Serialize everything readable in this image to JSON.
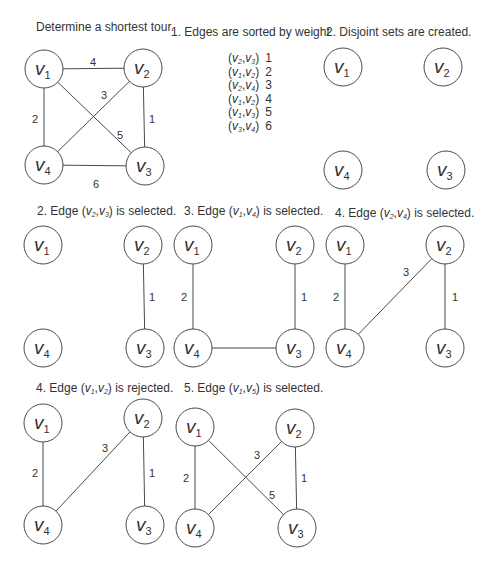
{
  "colors": {
    "stroke": "#4a4a4a",
    "text": "#333333",
    "node_fill": "#ffffff",
    "background": "#ffffff"
  },
  "node_radius": 19,
  "panels": [
    {
      "id": "initial-graph",
      "title": {
        "prefix": "Determine a shortest tour.",
        "edge": null,
        "suffix": ""
      },
      "title_pos": {
        "x": 36,
        "y": 20
      },
      "nodes": [
        {
          "label": "v",
          "sub": "1",
          "x": 44,
          "y": 69
        },
        {
          "label": "v",
          "sub": "2",
          "x": 143,
          "y": 68
        },
        {
          "label": "v",
          "sub": "3",
          "x": 145,
          "y": 166
        },
        {
          "label": "v",
          "sub": "4",
          "x": 44,
          "y": 165
        }
      ],
      "edges": [
        {
          "from": 0,
          "to": 1,
          "weight": "4",
          "lx": 93,
          "ly": 63
        },
        {
          "from": 0,
          "to": 3,
          "weight": "2",
          "lx": 35,
          "ly": 120
        },
        {
          "from": 1,
          "to": 2,
          "weight": "1",
          "lx": 152,
          "ly": 120
        },
        {
          "from": 1,
          "to": 3,
          "weight": "3",
          "lx": 104,
          "ly": 96
        },
        {
          "from": 0,
          "to": 2,
          "weight": "5",
          "lx": 120,
          "ly": 136
        },
        {
          "from": 3,
          "to": 2,
          "weight": "6",
          "lx": 96,
          "ly": 185
        }
      ]
    },
    {
      "id": "disjoint-sets",
      "title": {
        "prefix": "2. Disjoint sets are created.",
        "edge": null,
        "suffix": ""
      },
      "title_pos": {
        "x": 326,
        "y": 25
      },
      "nodes": [
        {
          "label": "v",
          "sub": "1",
          "x": 343,
          "y": 67
        },
        {
          "label": "v",
          "sub": "2",
          "x": 443,
          "y": 67
        },
        {
          "label": "v",
          "sub": "3",
          "x": 446,
          "y": 170
        },
        {
          "label": "v",
          "sub": "4",
          "x": 343,
          "y": 170
        }
      ],
      "edges": []
    },
    {
      "id": "step-edge-v2-v3",
      "title": {
        "prefix": "2. Edge (",
        "edge": [
          {
            "v": "v",
            "s": "2"
          },
          {
            "v": "v",
            "s": "3"
          }
        ],
        "suffix": ") is selected."
      },
      "title_pos": {
        "x": 37,
        "y": 204
      },
      "nodes": [
        {
          "label": "v",
          "sub": "1",
          "x": 43,
          "y": 245
        },
        {
          "label": "v",
          "sub": "2",
          "x": 143,
          "y": 245
        },
        {
          "label": "v",
          "sub": "3",
          "x": 145,
          "y": 348
        },
        {
          "label": "v",
          "sub": "4",
          "x": 43,
          "y": 348
        }
      ],
      "edges": [
        {
          "from": 1,
          "to": 2,
          "weight": "1",
          "lx": 152,
          "ly": 298
        }
      ]
    },
    {
      "id": "step-edge-v1-v4",
      "title": {
        "prefix": "3. Edge (",
        "edge": [
          {
            "v": "v",
            "s": "1"
          },
          {
            "v": "v",
            "s": "4"
          }
        ],
        "suffix": ") is selected."
      },
      "title_pos": {
        "x": 184,
        "y": 204
      },
      "nodes": [
        {
          "label": "v",
          "sub": "1",
          "x": 193,
          "y": 245
        },
        {
          "label": "v",
          "sub": "2",
          "x": 295,
          "y": 245
        },
        {
          "label": "v",
          "sub": "3",
          "x": 295,
          "y": 348
        },
        {
          "label": "v",
          "sub": "4",
          "x": 193,
          "y": 348
        }
      ],
      "edges": [
        {
          "from": 0,
          "to": 3,
          "weight": "2",
          "lx": 184,
          "ly": 298
        },
        {
          "from": 1,
          "to": 2,
          "weight": "1",
          "lx": 304,
          "ly": 298
        },
        {
          "from": 3,
          "to": 2,
          "weight": "",
          "lx": 0,
          "ly": 0
        }
      ]
    },
    {
      "id": "step-edge-v2-v4",
      "title": {
        "prefix": "4. Edge (",
        "edge": [
          {
            "v": "v",
            "s": "2"
          },
          {
            "v": "v",
            "s": "4"
          }
        ],
        "suffix": ") is selected."
      },
      "title_pos": {
        "x": 335,
        "y": 206
      },
      "nodes": [
        {
          "label": "v",
          "sub": "1",
          "x": 345,
          "y": 245
        },
        {
          "label": "v",
          "sub": "2",
          "x": 445,
          "y": 245
        },
        {
          "label": "v",
          "sub": "3",
          "x": 445,
          "y": 348
        },
        {
          "label": "v",
          "sub": "4",
          "x": 345,
          "y": 348
        }
      ],
      "edges": [
        {
          "from": 0,
          "to": 3,
          "weight": "2",
          "lx": 336,
          "ly": 298
        },
        {
          "from": 1,
          "to": 3,
          "weight": "3",
          "lx": 406,
          "ly": 273
        },
        {
          "from": 1,
          "to": 2,
          "weight": "1",
          "lx": 455,
          "ly": 298
        }
      ]
    },
    {
      "id": "step-edge-v1-v2-rejected",
      "title": {
        "prefix": "4. Edge (",
        "edge": [
          {
            "v": "v",
            "s": "1"
          },
          {
            "v": "v",
            "s": "2"
          }
        ],
        "suffix": ") is rejected."
      },
      "title_pos": {
        "x": 36,
        "y": 381
      },
      "nodes": [
        {
          "label": "v",
          "sub": "1",
          "x": 43,
          "y": 423
        },
        {
          "label": "v",
          "sub": "2",
          "x": 143,
          "y": 418
        },
        {
          "label": "v",
          "sub": "3",
          "x": 145,
          "y": 525
        },
        {
          "label": "v",
          "sub": "4",
          "x": 43,
          "y": 525
        }
      ],
      "edges": [
        {
          "from": 0,
          "to": 3,
          "weight": "2",
          "lx": 35,
          "ly": 474
        },
        {
          "from": 1,
          "to": 3,
          "weight": "3",
          "lx": 105,
          "ly": 449
        },
        {
          "from": 1,
          "to": 2,
          "weight": "1",
          "lx": 152,
          "ly": 474
        }
      ]
    },
    {
      "id": "step-edge-v1-v5",
      "title": {
        "prefix": "5. Edge (",
        "edge": [
          {
            "v": "v",
            "s": "1"
          },
          {
            "v": "v",
            "s": "5"
          }
        ],
        "suffix": ") is selected."
      },
      "title_pos": {
        "x": 184,
        "y": 381
      },
      "nodes": [
        {
          "label": "v",
          "sub": "1",
          "x": 195,
          "y": 427
        },
        {
          "label": "v",
          "sub": "2",
          "x": 295,
          "y": 428
        },
        {
          "label": "v",
          "sub": "3",
          "x": 297,
          "y": 528
        },
        {
          "label": "v",
          "sub": "4",
          "x": 195,
          "y": 528
        }
      ],
      "edges": [
        {
          "from": 0,
          "to": 3,
          "weight": "2",
          "lx": 186,
          "ly": 479
        },
        {
          "from": 1,
          "to": 3,
          "weight": "3",
          "lx": 257,
          "ly": 456
        },
        {
          "from": 1,
          "to": 2,
          "weight": "1",
          "lx": 304,
          "ly": 479
        },
        {
          "from": 0,
          "to": 2,
          "weight": "5",
          "lx": 272,
          "ly": 496
        }
      ]
    }
  ],
  "sorted_edges": {
    "heading": "1. Edges are sorted by weight",
    "heading_pos": {
      "x": 171,
      "y": 25
    },
    "rows": [
      {
        "a": "2",
        "b": "3",
        "weight": "1"
      },
      {
        "a": "1",
        "b": "2",
        "weight": "2"
      },
      {
        "a": "2",
        "b": "4",
        "weight": "3"
      },
      {
        "a": "1",
        "b": "2",
        "weight": "4"
      },
      {
        "a": "1",
        "b": "3",
        "weight": "5"
      },
      {
        "a": "3",
        "b": "4",
        "weight": "6"
      }
    ]
  }
}
